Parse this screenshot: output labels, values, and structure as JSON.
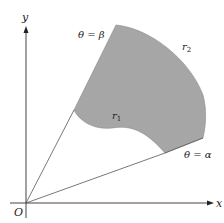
{
  "diagram": {
    "labels": {
      "y_axis": "y",
      "x_axis": "x",
      "origin": "O",
      "theta_beta": "θ = β",
      "theta_alpha": "θ = α",
      "inner_curve": "r1",
      "outer_curve": "r2"
    },
    "colors": {
      "region_fill": "#a6a6a6",
      "axis": "#444444",
      "ray": "#555555",
      "text": "#222222"
    }
  }
}
